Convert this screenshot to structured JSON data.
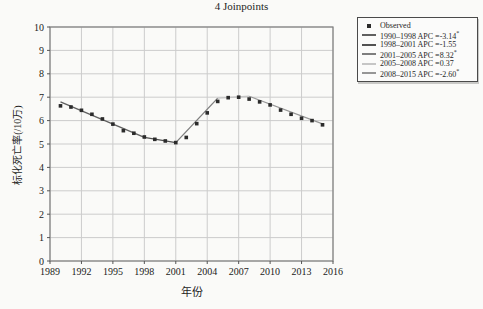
{
  "page": {
    "background": "#fafaf8"
  },
  "chart_data": {
    "type": "line",
    "title": "4 Joinpoints",
    "xlabel": "年份",
    "ylabel": "标化死亡率(/10万)",
    "xlim": [
      1989,
      2016
    ],
    "ylim": [
      0,
      10
    ],
    "xticks": [
      1989,
      1992,
      1995,
      1998,
      2001,
      2004,
      2007,
      2010,
      2013,
      2016
    ],
    "yticks": [
      0,
      1,
      2,
      3,
      4,
      5,
      6,
      7,
      8,
      9,
      10
    ],
    "grid": true,
    "grid_color": "#cccccc",
    "frame_color": "#7f7f7f",
    "legend_position": "outside-top-right",
    "observed": {
      "name": "Observed",
      "marker": "square",
      "color": "#2b2b2b",
      "years": [
        1990,
        1991,
        1992,
        1993,
        1994,
        1995,
        1996,
        1997,
        1998,
        1999,
        2000,
        2001,
        2002,
        2003,
        2004,
        2005,
        2006,
        2007,
        2008,
        2009,
        2010,
        2011,
        2012,
        2013,
        2014,
        2015
      ],
      "values": [
        6.63,
        6.58,
        6.44,
        6.27,
        6.07,
        5.85,
        5.57,
        5.46,
        5.3,
        5.2,
        5.13,
        5.06,
        5.28,
        5.87,
        6.33,
        6.82,
        6.98,
        7.0,
        6.92,
        6.8,
        6.67,
        6.45,
        6.27,
        6.1,
        6.0,
        5.82
      ]
    },
    "segments": [
      {
        "label": "1990–1998 APC =-3.14",
        "sig": "*",
        "x": [
          1990,
          1998
        ],
        "y": [
          6.8,
          5.28
        ],
        "color": "#606060"
      },
      {
        "label": "1998–2001 APC =-1.55",
        "sig": "",
        "x": [
          1998,
          2001
        ],
        "y": [
          5.28,
          5.06
        ],
        "color": "#525252"
      },
      {
        "label": "2001–2005 APC =8.32",
        "sig": "*",
        "x": [
          2001,
          2005
        ],
        "y": [
          5.06,
          6.96
        ],
        "color": "#7e7e7e"
      },
      {
        "label": "2005–2008 APC =0.37",
        "sig": "",
        "x": [
          2005,
          2008
        ],
        "y": [
          6.96,
          7.04
        ],
        "color": "#c6c6c6"
      },
      {
        "label": "2008–2015 APC =-2.60",
        "sig": "*",
        "x": [
          2008,
          2015
        ],
        "y": [
          7.04,
          5.86
        ],
        "color": "#969696"
      }
    ]
  },
  "legend": {
    "observed_label": "Observed"
  }
}
